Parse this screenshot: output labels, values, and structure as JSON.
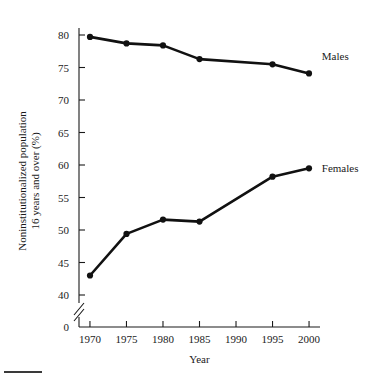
{
  "chart_data": {
    "type": "line",
    "title": "",
    "subtitle": "",
    "xlabel": "Year",
    "ylabel": "Noninstitutionalized population 16 years and over (%)",
    "ylabel_line1": "Noninstitutionalized population",
    "ylabel_line2": "16 years and over (%)",
    "x": [
      1970,
      1975,
      1980,
      1985,
      1990,
      1995,
      2000
    ],
    "xtick_labels": [
      "1970",
      "1975",
      "1980",
      "1985",
      "1990",
      "1995",
      "2000"
    ],
    "ytick_labels": [
      "0",
      "40",
      "45",
      "50",
      "55",
      "60",
      "65",
      "70",
      "75",
      "80"
    ],
    "ytick_values": [
      0,
      40,
      45,
      50,
      55,
      60,
      65,
      70,
      75,
      80
    ],
    "ylim": [
      40,
      80
    ],
    "xlim": [
      1968.5,
      2001.5
    ],
    "y_axis_break": true,
    "y_axis_break_label": "0",
    "grid": false,
    "legend_position": "inline-right",
    "series": [
      {
        "name": "Males",
        "label": "Males",
        "color": "#111111",
        "x": [
          1970,
          1975,
          1980,
          1985,
          1995,
          2000
        ],
        "values": [
          79.7,
          78.7,
          78.4,
          76.3,
          75.5,
          74.1
        ]
      },
      {
        "name": "Females",
        "label": "Females",
        "color": "#111111",
        "x": [
          1970,
          1975,
          1980,
          1985,
          1995,
          2000
        ],
        "values": [
          43.0,
          49.4,
          51.6,
          51.3,
          58.2,
          59.5
        ]
      }
    ],
    "annotations": [
      {
        "text": "Males",
        "x": 2001.2,
        "y": 76.8
      },
      {
        "text": "Females",
        "x": 2001.2,
        "y": 59.6
      }
    ]
  }
}
